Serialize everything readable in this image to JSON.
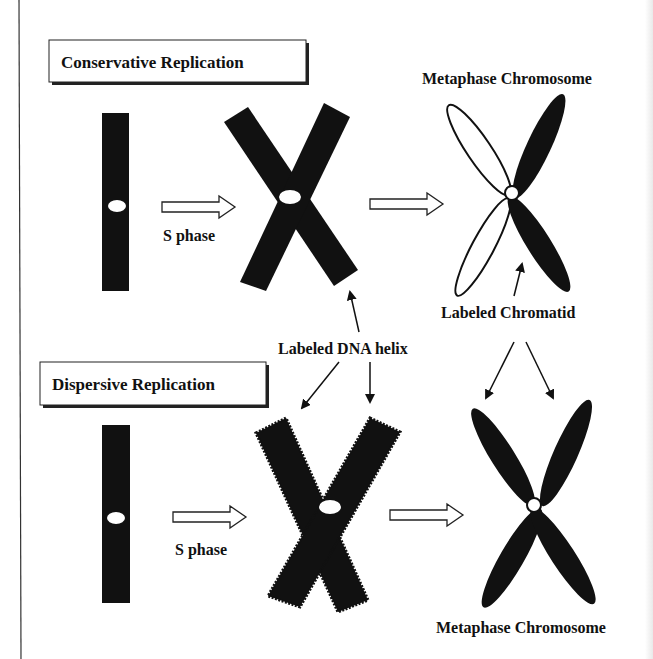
{
  "colors": {
    "ink": "#111111",
    "paper": "#ffffff",
    "frame": "#333333"
  },
  "diagram": {
    "sections": [
      {
        "title": "Conservative Replication",
        "phase_label": "S phase",
        "result_label": "Metaphase Chromosome",
        "annotation": "Labeled Chromatid"
      },
      {
        "title": "Dispersive Replication",
        "phase_label": "S phase",
        "result_label": "Metaphase Chromosome"
      }
    ],
    "shared_annotation": "Labeled DNA helix"
  }
}
